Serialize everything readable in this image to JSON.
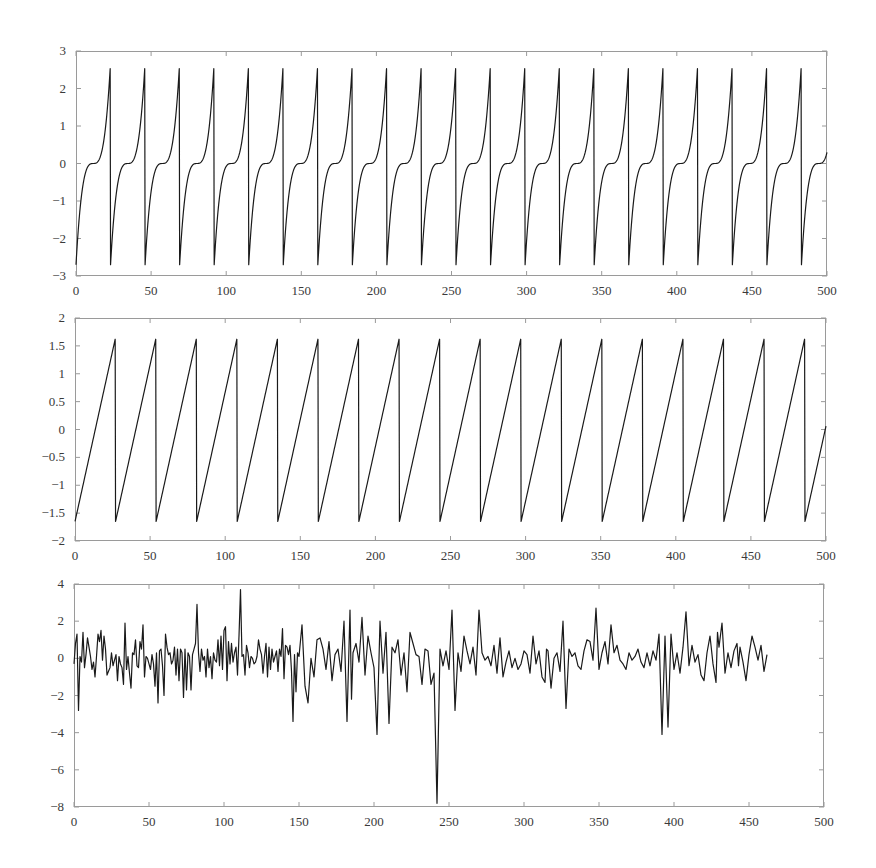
{
  "chart_data": [
    {
      "id": "top",
      "type": "line",
      "title": "",
      "xlabel": "",
      "ylabel": "",
      "xlim": [
        0,
        500
      ],
      "ylim": [
        -3,
        3
      ],
      "grid": false,
      "legend": null,
      "xticks": [
        0,
        50,
        100,
        150,
        200,
        250,
        300,
        350,
        400,
        450,
        500
      ],
      "yticks": [
        -3,
        -2,
        -1,
        0,
        1,
        2,
        3
      ],
      "ytick_labels": [
        "−3",
        "−2",
        "−1",
        "0",
        "1",
        "2",
        "3"
      ],
      "xtick_labels": [
        "0",
        "50",
        "100",
        "150",
        "200",
        "250",
        "300",
        "350",
        "400",
        "450",
        "500"
      ],
      "description": "Periodic cubic-shaped spikes: each cycle rises from -2.7 through a flat plateau at 0 to +2.7, then drops abruptly; period ≈ 23",
      "generator": {
        "kind": "cubic_sawtooth",
        "period": 23,
        "amplitude": 2.7,
        "phase": 0
      },
      "series": [
        {
          "name": "signal 1",
          "color": "#1a1a1a",
          "x": [
            0,
            2,
            4,
            6,
            8,
            10,
            11.5,
            13,
            15,
            17,
            19,
            21,
            22.9,
            23,
            25,
            27,
            29,
            31,
            33,
            34.5,
            36,
            38,
            40,
            42,
            44,
            45.9,
            46,
            230,
            253,
            276,
            299,
            322,
            345,
            368,
            391,
            414,
            437,
            460,
            483,
            500
          ],
          "values": [
            -2.7,
            -1.53,
            -0.76,
            -0.29,
            -0.06,
            0.0,
            0.0,
            0.0,
            0.06,
            0.29,
            0.76,
            1.53,
            2.7,
            -2.7,
            -1.53,
            -0.76,
            -0.29,
            -0.06,
            0.0,
            0.0,
            0.0,
            0.06,
            0.29,
            0.76,
            1.53,
            2.7,
            -2.7,
            -2.7,
            -2.7,
            -2.7,
            -2.7,
            -2.7,
            -2.7,
            -2.7,
            -2.7,
            -2.7,
            -2.7,
            -2.7,
            -2.7,
            -0.03
          ]
        }
      ]
    },
    {
      "id": "middle",
      "type": "line",
      "title": "",
      "xlabel": "",
      "ylabel": "",
      "xlim": [
        0,
        500
      ],
      "ylim": [
        -2,
        2
      ],
      "grid": false,
      "legend": null,
      "xticks": [
        0,
        50,
        100,
        150,
        200,
        250,
        300,
        350,
        400,
        450,
        500
      ],
      "yticks": [
        -2,
        -1.5,
        -1,
        -0.5,
        0,
        0.5,
        1,
        1.5,
        2
      ],
      "ytick_labels": [
        "−2",
        "−1.5",
        "−1",
        "−0.5",
        "0",
        "0.5",
        "1",
        "1.5",
        "2"
      ],
      "xtick_labels": [
        "0",
        "50",
        "100",
        "150",
        "200",
        "250",
        "300",
        "350",
        "400",
        "450",
        "500"
      ],
      "description": "Linear sawtooth from -1.65 to +1.65 with abrupt drops; period ≈ 27",
      "generator": {
        "kind": "linear_sawtooth",
        "period": 27,
        "amplitude": 1.65,
        "phase": 0
      },
      "series": [
        {
          "name": "signal 2",
          "color": "#1a1a1a",
          "x": [
            0,
            27,
            27.01,
            54,
            54.01,
            81,
            81.01,
            108,
            108.01,
            135,
            135.01,
            162,
            162.01,
            189,
            189.01,
            216,
            216.01,
            243,
            243.01,
            270,
            270.01,
            297,
            297.01,
            324,
            324.01,
            351,
            351.01,
            378,
            378.01,
            405,
            405.01,
            432,
            432.01,
            459,
            459.01,
            486,
            486.01,
            500
          ],
          "values": [
            -1.65,
            1.65,
            -1.65,
            1.65,
            -1.65,
            1.65,
            -1.65,
            1.65,
            -1.65,
            1.65,
            -1.65,
            1.65,
            -1.65,
            1.65,
            -1.65,
            1.65,
            -1.65,
            1.65,
            -1.65,
            1.65,
            -1.65,
            1.65,
            -1.65,
            1.65,
            -1.65,
            1.65,
            -1.65,
            1.65,
            -1.65,
            1.65,
            -1.65,
            1.65,
            -1.65,
            1.65,
            -1.65,
            1.65,
            -1.65,
            0.06
          ]
        }
      ]
    },
    {
      "id": "bottom",
      "type": "line",
      "title": "",
      "xlabel": "",
      "ylabel": "",
      "xlim": [
        0,
        500
      ],
      "ylim": [
        -8,
        4
      ],
      "grid": false,
      "legend": null,
      "xticks": [
        0,
        50,
        100,
        150,
        200,
        250,
        300,
        350,
        400,
        450,
        500
      ],
      "yticks": [
        -8,
        -6,
        -4,
        -2,
        0,
        2,
        4
      ],
      "ytick_labels": [
        "−8",
        "−6",
        "−4",
        "−2",
        "0",
        "2",
        "4"
      ],
      "xtick_labels": [
        "0",
        "50",
        "100",
        "150",
        "200",
        "250",
        "300",
        "350",
        "400",
        "450",
        "500"
      ],
      "description": "Noisy signal centered near 0, mostly within ±2, with notable spikes",
      "annotations_observed": [
        {
          "x": 3,
          "y": -2.8
        },
        {
          "x": 98,
          "y": 2.9
        },
        {
          "x": 138,
          "y": 3.7
        },
        {
          "x": 185,
          "y": -3.4
        },
        {
          "x": 218,
          "y": -3.4
        },
        {
          "x": 224,
          "y": 2.6
        },
        {
          "x": 248,
          "y": -4.1
        },
        {
          "x": 283,
          "y": -7.8
        },
        {
          "x": 292,
          "y": 2.6
        },
        {
          "x": 315,
          "y": 2.6
        },
        {
          "x": 370,
          "y": -2.7
        },
        {
          "x": 390,
          "y": 2.7
        },
        {
          "x": 429,
          "y": -4.1
        },
        {
          "x": 432,
          "y": -3.7
        },
        {
          "x": 443,
          "y": 2.5
        }
      ],
      "series": [
        {
          "name": "signal 3",
          "color": "#1a1a1a",
          "x": [
            0,
            1,
            2,
            3,
            4,
            5,
            6,
            7,
            8,
            9,
            10,
            11,
            12,
            13,
            14,
            15,
            16,
            17,
            18,
            19,
            20,
            21,
            22,
            23,
            24,
            25,
            26,
            27,
            28,
            29,
            30,
            31,
            32,
            33,
            34,
            35,
            36,
            37,
            38,
            39,
            40,
            41,
            42,
            43,
            44,
            45,
            46,
            47,
            48,
            49,
            50,
            51,
            52,
            53,
            54,
            55,
            56,
            57,
            58,
            59,
            60,
            61,
            62,
            63,
            64,
            65,
            66,
            67,
            68,
            69,
            70,
            71,
            72,
            73,
            74,
            75,
            76,
            77,
            78,
            79,
            80,
            81,
            82,
            83,
            84,
            85,
            86,
            87,
            88,
            89,
            90,
            91,
            92,
            93,
            94,
            95,
            96,
            97,
            98,
            99,
            100,
            101,
            102,
            103,
            104,
            105,
            106,
            107,
            108,
            109,
            110,
            111,
            112,
            113,
            114,
            115,
            116,
            117,
            118,
            119,
            120,
            121,
            122,
            123,
            124,
            125,
            126,
            127,
            128,
            129,
            130,
            131,
            132,
            133,
            134,
            135,
            136,
            137,
            138,
            139,
            140,
            141,
            142,
            143,
            144,
            145,
            146,
            147,
            148,
            149,
            150,
            152,
            154,
            156,
            158,
            160,
            162,
            164,
            166,
            168,
            170,
            172,
            174,
            176,
            178,
            180,
            182,
            184,
            185,
            186,
            188,
            190,
            192,
            194,
            196,
            198,
            200,
            202,
            204,
            206,
            208,
            210,
            212,
            214,
            216,
            218,
            220,
            222,
            224,
            226,
            228,
            230,
            232,
            234,
            236,
            238,
            240,
            242,
            244,
            246,
            248,
            250,
            252,
            254,
            256,
            258,
            260,
            262,
            264,
            266,
            268,
            270,
            272,
            274,
            276,
            278,
            280,
            282,
            283,
            284,
            286,
            288,
            290,
            292,
            294,
            296,
            298,
            300,
            302,
            304,
            306,
            308,
            310,
            312,
            314,
            315,
            316,
            318,
            320,
            322,
            324,
            326,
            328,
            330,
            332,
            334,
            336,
            338,
            340,
            342,
            344,
            346,
            348,
            350,
            352,
            354,
            356,
            358,
            360,
            362,
            364,
            366,
            368,
            370,
            372,
            374,
            376,
            378,
            380,
            382,
            384,
            386,
            388,
            390,
            392,
            394,
            396,
            398,
            400,
            402,
            404,
            406,
            408,
            410,
            412,
            414,
            416,
            418,
            420,
            422,
            424,
            426,
            428,
            429,
            430,
            432,
            434,
            436,
            438,
            440,
            442,
            443,
            444,
            446,
            448,
            450,
            452,
            454,
            456,
            458,
            460,
            462,
            464,
            466,
            468,
            470,
            472,
            474,
            476,
            478,
            480,
            482,
            484,
            486,
            488,
            490,
            492,
            494,
            496,
            498,
            500
          ],
          "values": [
            -0.3,
            0.8,
            1.3,
            -2.8,
            0.1,
            -0.2,
            1.4,
            -0.5,
            0.2,
            1.1,
            0.6,
            0.1,
            -0.6,
            -0.2,
            -1.0,
            0.1,
            1.3,
            0.9,
            1.5,
            -0.1,
            1.2,
            0.5,
            -0.9,
            -0.7,
            -0.5,
            0.3,
            -0.4,
            -0.1,
            0.2,
            -1.2,
            0.1,
            -0.3,
            -0.5,
            -1.4,
            1.9,
            -0.6,
            0.1,
            -0.8,
            -1.6,
            0.3,
            0.2,
            1.0,
            -0.4,
            -0.5,
            0.9,
            0.5,
            1.8,
            -1.0,
            0.1,
            0.0,
            -0.3,
            -0.6,
            0.2,
            -0.3,
            -1.5,
            0.3,
            -2.4,
            0.4,
            0.5,
            -0.4,
            -2.0,
            1.3,
            0.6,
            0.2,
            0.3,
            -0.3,
            -0.1,
            0.6,
            -0.9,
            0.5,
            -1.2,
            0.5,
            0.3,
            -2.1,
            0.5,
            -1.7,
            0.3,
            0.1,
            -1.7,
            0.2,
            0.5,
            0.8,
            2.9,
            0.3,
            -0.7,
            0.5,
            -0.1,
            0.1,
            -1.0,
            0.5,
            -0.5,
            0.1,
            -1.1,
            0.3,
            -0.1,
            -0.2,
            1.0,
            -0.4,
            1.2,
            -0.6,
            1.5,
            1.7,
            -1.2,
            0.9,
            -0.3,
            0.8,
            -0.2,
            0.3,
            0.6,
            -0.9,
            1.2,
            3.7,
            0.1,
            0.2,
            -0.9,
            0.7,
            0.3,
            -0.5,
            0.1,
            0.0,
            -0.3,
            -0.2,
            0.1,
            1.0,
            0.5,
            0.2,
            -0.8,
            0.1,
            0.8,
            -1.0,
            0.6,
            -0.6,
            0.5,
            -0.2,
            0.1,
            0.4,
            -0.7,
            0.5,
            0.1,
            1.6,
            -1.1,
            0.7,
            0.6,
            0.2,
            0.7,
            -0.7,
            -3.4,
            0.2,
            -1.8,
            0.3,
            0.1,
            1.8,
            -1.5,
            -2.4,
            0.0,
            -1.0,
            1.0,
            1.1,
            0.5,
            -0.6,
            0.9,
            -1.2,
            0.2,
            0.5,
            -0.7,
            2.0,
            -3.4,
            2.6,
            -2.2,
            0.3,
            0.8,
            -0.2,
            2.2,
            -0.9,
            1.2,
            0.3,
            -0.5,
            -4.1,
            2.0,
            -0.8,
            1.4,
            -3.5,
            0.6,
            0.3,
            1.0,
            -0.9,
            0.3,
            -1.8,
            1.4,
            0.8,
            0.2,
            0.1,
            -1.4,
            0.5,
            0.4,
            -1.4,
            -0.8,
            -7.8,
            0.5,
            -0.4,
            0.4,
            -0.6,
            2.6,
            -2.8,
            0.3,
            -0.7,
            1.2,
            0.4,
            -0.3,
            0.6,
            -0.9,
            2.6,
            0.3,
            -0.1,
            0.1,
            -0.4,
            0.7,
            -0.8,
            0.2,
            1.1,
            -1.0,
            -0.2,
            0.4,
            -0.5,
            0.0,
            -0.6,
            -0.3,
            0.4,
            0.2,
            -0.8,
            1.2,
            -0.3,
            0.4,
            -1.0,
            -1.3,
            0.5,
            0.4,
            -1.6,
            0.0,
            0.3,
            -0.7,
            2.0,
            -2.7,
            0.5,
            0.1,
            0.3,
            -0.4,
            -0.6,
            0.4,
            1.0,
            0.9,
            -0.1,
            2.7,
            -0.6,
            0.3,
            0.9,
            -0.3,
            1.8,
            0.3,
            0.7,
            -0.1,
            -0.3,
            -0.6,
            0.3,
            -0.1,
            0.1,
            0.5,
            -0.2,
            -0.5,
            0.3,
            -0.4,
            0.4,
            -0.1,
            1.3,
            -4.1,
            1.2,
            -3.7,
            1.3,
            -0.6,
            0.3,
            -0.8,
            0.6,
            2.5,
            -0.4,
            0.7,
            -0.2,
            0.2,
            -0.9,
            -1.2,
            0.3,
            1.2,
            -0.3,
            -1.3,
            1.4,
            0.6,
            1.9,
            -0.8,
            0.3,
            -0.5,
            0.4,
            0.8,
            -0.4,
            0.6,
            -0.2,
            -1.2,
            0.2,
            1.2,
            0.6,
            -0.1,
            0.7,
            -0.7,
            0.2
          ]
        }
      ]
    }
  ],
  "panels": [
    {
      "id": "top",
      "frame": {
        "left": 76,
        "top": 51,
        "width": 751,
        "height": 225
      }
    },
    {
      "id": "middle",
      "frame": {
        "left": 75,
        "top": 318,
        "width": 751,
        "height": 223
      }
    },
    {
      "id": "bottom",
      "frame": {
        "left": 74,
        "top": 584,
        "width": 750,
        "height": 223
      }
    }
  ]
}
